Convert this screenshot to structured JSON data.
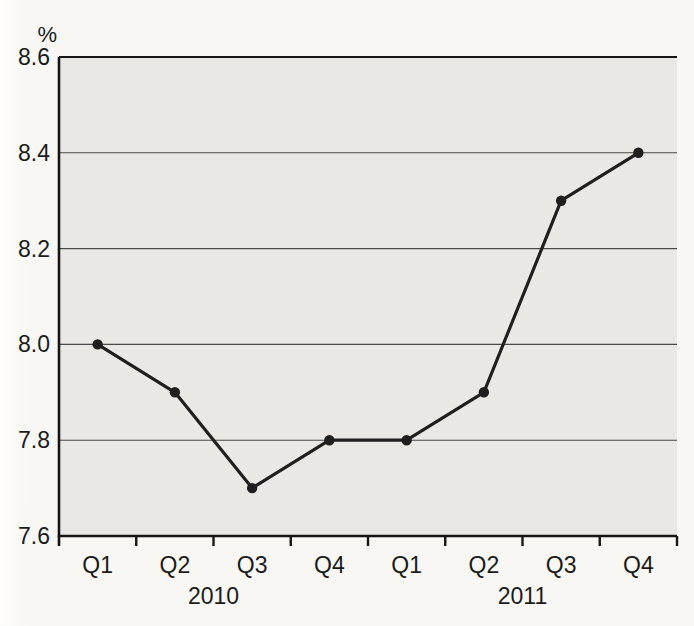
{
  "chart_data": {
    "type": "line",
    "title": "",
    "unit_label": "%",
    "categories": [
      "Q1",
      "Q2",
      "Q3",
      "Q4",
      "Q1",
      "Q2",
      "Q3",
      "Q4"
    ],
    "year_groups": [
      {
        "label": "2010",
        "start": 0,
        "end": 3
      },
      {
        "label": "2011",
        "start": 4,
        "end": 7
      }
    ],
    "series": [
      {
        "name": "quarterly-rate",
        "values": [
          8.0,
          7.9,
          7.7,
          7.8,
          7.8,
          7.9,
          8.3,
          8.4
        ]
      }
    ],
    "ylim": [
      7.6,
      8.6
    ],
    "yticks": [
      7.6,
      7.8,
      8.0,
      8.2,
      8.4,
      8.6
    ],
    "ytick_labels": [
      "7.6",
      "7.8",
      "8.0",
      "8.2",
      "8.4",
      "8.6"
    ],
    "grid": true,
    "legend": "none",
    "colors": {
      "line": "#1f1f1f",
      "marker": "#1f1f1f",
      "plot_background": "#e9e8e4",
      "page_background": "#f8f7f4",
      "page_edge": "#fdfdfb",
      "gridline": "#4a4a4a",
      "axis": "#161616",
      "text": "#1b1b1b"
    }
  }
}
